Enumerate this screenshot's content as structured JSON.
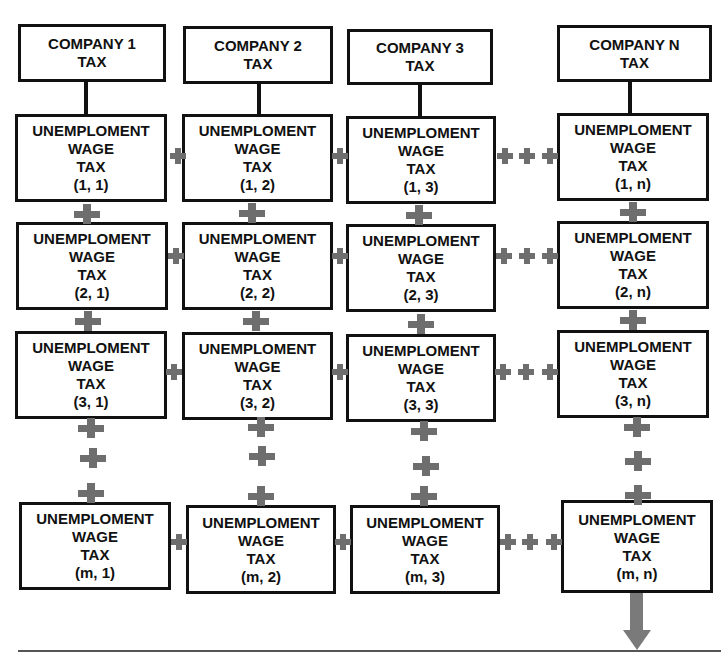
{
  "diagram": {
    "companies": [
      {
        "line1": "COMPANY 1",
        "line2": "TAX"
      },
      {
        "line1": "COMPANY 2",
        "line2": "TAX"
      },
      {
        "line1": "COMPANY 3",
        "line2": "TAX"
      },
      {
        "line1": "COMPANY N",
        "line2": "TAX"
      }
    ],
    "cell_label": {
      "line1": "UNEMPLOMENT",
      "line2": "WAGE",
      "line3": "TAX"
    },
    "cells": [
      [
        "(1, 1)",
        "(1, 2)",
        "(1, 3)",
        "(1, n)"
      ],
      [
        "(2, 1)",
        "(2, 2)",
        "(2, 3)",
        "(2, n)"
      ],
      [
        "(3, 1)",
        "(3, 2)",
        "(3, 3)",
        "(3, n)"
      ],
      [
        "(m, 1)",
        "(m, 2)",
        "(m, 3)",
        "(m, n)"
      ]
    ],
    "connector_symbol": "+",
    "connector_color": "#6e6e6e",
    "arrow_color": "#7a7a7a",
    "border_color": "#111111"
  }
}
